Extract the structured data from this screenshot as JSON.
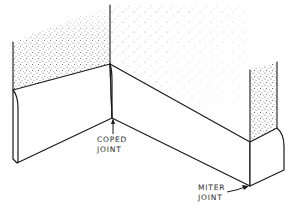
{
  "diagram": {
    "labels": {
      "coped": {
        "line1": "COPED",
        "line2": "JOINT"
      },
      "miter": {
        "line1": "MITER",
        "line2": "JOINT"
      }
    },
    "colors": {
      "line": "#1a1a1a",
      "stipple": "#3a3a3a",
      "background": "#ffffff"
    }
  }
}
